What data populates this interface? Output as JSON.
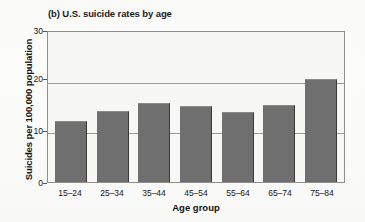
{
  "figure": {
    "panel_label": "(b)",
    "title": "(b) U.S. suicide rates by age",
    "background_color": "#fcfcfb",
    "plot_background_color": "#f7f7f5",
    "bar_color": "#6f6f6f",
    "axis_color": "#8d8d8d"
  },
  "chart_data": {
    "type": "bar",
    "title": "(b) U.S. suicide rates by age",
    "xlabel": "Age group",
    "ylabel": "Suicides per 100,000 population",
    "categories": [
      "15–24",
      "25–34",
      "35–44",
      "45–54",
      "55–64",
      "65–74",
      "75–84"
    ],
    "values": [
      12.0,
      14.0,
      15.6,
      15.0,
      13.9,
      15.2,
      20.3
    ],
    "ylim": [
      0,
      30
    ],
    "yticks": [
      0,
      10,
      20,
      30
    ],
    "ytick_labels": [
      "0",
      "10",
      "20",
      "30"
    ],
    "gridlines": [
      10,
      20
    ],
    "grid": true,
    "legend": null,
    "series": [
      {
        "name": "U.S. suicide rate",
        "values": [
          12.0,
          14.0,
          15.6,
          15.0,
          13.9,
          15.2,
          20.3
        ]
      }
    ]
  }
}
